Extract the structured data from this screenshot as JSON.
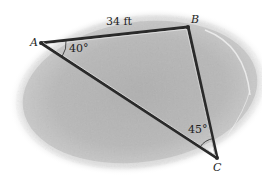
{
  "diagram": {
    "type": "truss-triangle",
    "vertices": {
      "A": {
        "label": "A",
        "x": 41,
        "y": 43
      },
      "B": {
        "label": "B",
        "x": 188,
        "y": 27
      },
      "C": {
        "label": "C",
        "x": 217,
        "y": 158
      }
    },
    "members": [
      {
        "from": "A",
        "to": "B"
      },
      {
        "from": "B",
        "to": "C"
      },
      {
        "from": "A",
        "to": "C"
      }
    ],
    "dimensions": {
      "AB_length": "34 ft"
    },
    "angles": {
      "A": "40°",
      "C": "45°"
    },
    "colors": {
      "background_blob": "#b8b8b8",
      "member_stroke": "#2a2a2a",
      "member_highlight": "#e6e6e6",
      "text": "#1e1e1e"
    }
  }
}
